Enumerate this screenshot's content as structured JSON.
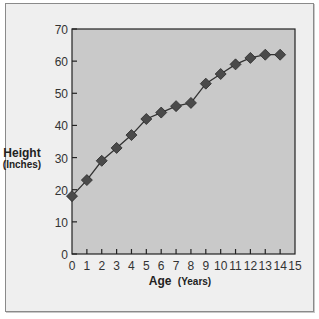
{
  "chart_data": {
    "type": "line",
    "title": "",
    "xlabel": "Age",
    "xlabel_unit": "(Years)",
    "ylabel": "Height",
    "ylabel_unit": "(Inches)",
    "x": [
      0,
      1,
      2,
      3,
      4,
      5,
      6,
      7,
      8,
      9,
      10,
      11,
      12,
      13,
      14
    ],
    "series": [
      {
        "name": "Height",
        "values": [
          18,
          23,
          29,
          33,
          37,
          42,
          44,
          46,
          47,
          53,
          56,
          59,
          61,
          62,
          62
        ],
        "marker": "diamond",
        "color": "#4a4a4a"
      }
    ],
    "xlim": [
      0,
      15
    ],
    "ylim": [
      0,
      70
    ],
    "xticks": [
      0,
      1,
      2,
      3,
      4,
      5,
      6,
      7,
      8,
      9,
      10,
      11,
      12,
      13,
      14,
      15
    ],
    "yticks": [
      0,
      10,
      20,
      30,
      40,
      50,
      60,
      70
    ],
    "grid": false,
    "legend": null
  },
  "colors": {
    "plot_bg": "#c9c9c9",
    "frame_bg": "#efefef",
    "marker": "#4a4a4a",
    "line": "#333333",
    "axis": "#222222"
  }
}
